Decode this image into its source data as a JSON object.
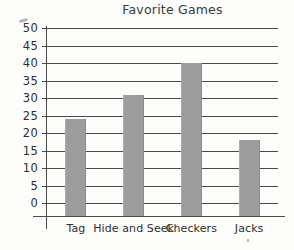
{
  "chart_data": {
    "type": "bar",
    "title": "Favorite Games",
    "xlabel": "",
    "ylabel": "",
    "categories": [
      "Tag",
      "Hide and Seek",
      "Checkers",
      "Jacks"
    ],
    "values": [
      24,
      31,
      40,
      18
    ],
    "ylim": [
      0,
      50
    ],
    "yticks": [
      0,
      5,
      10,
      15,
      20,
      25,
      30,
      35,
      40,
      45,
      50
    ],
    "ytick_labels": [
      "0",
      "5",
      "10",
      "15",
      "20",
      "25",
      "30",
      "35",
      "40",
      "45",
      "50"
    ],
    "grid": true,
    "legend": false,
    "bar_color": "#9d9d9d",
    "axis_color": "#4a4a4a",
    "text_color": "#2e2e2e",
    "background": "#fdfdfb"
  }
}
